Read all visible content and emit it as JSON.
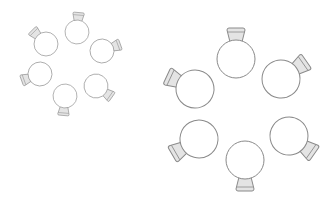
{
  "figure": {
    "colors": {
      "stroke": "#8a8a8a",
      "neck_fill": "#e4e4e4",
      "bulb_fill": "#ffffff",
      "background": "#ffffff"
    }
  },
  "rings": [
    {
      "name": "small-ring",
      "scale": 0.63,
      "flasks": [
        {
          "cx": 77,
          "cy": 32,
          "angle": 5
        },
        {
          "cx": 102,
          "cy": 51,
          "angle": 70
        },
        {
          "cx": 96,
          "cy": 86,
          "angle": 125
        },
        {
          "cx": 65,
          "cy": 96,
          "angle": 185
        },
        {
          "cx": 40,
          "cy": 74,
          "angle": 250
        },
        {
          "cx": 46,
          "cy": 44,
          "angle": 315
        }
      ]
    },
    {
      "name": "large-ring",
      "scale": 1.0,
      "flasks": [
        {
          "cx": 236,
          "cy": 59,
          "angle": 0
        },
        {
          "cx": 281,
          "cy": 79,
          "angle": 55
        },
        {
          "cx": 289,
          "cy": 136,
          "angle": 125
        },
        {
          "cx": 245,
          "cy": 160,
          "angle": 180
        },
        {
          "cx": 199,
          "cy": 139,
          "angle": 240
        },
        {
          "cx": 195,
          "cy": 89,
          "angle": 295
        }
      ]
    }
  ]
}
